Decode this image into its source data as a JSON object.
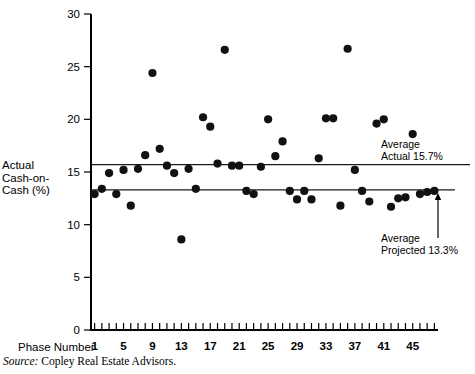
{
  "chart_data": {
    "type": "scatter",
    "title": "",
    "xlabel": "Phase Number",
    "ylabel": "Actual\nCash-on-\nCash (%)",
    "xlim": [
      0,
      49
    ],
    "ylim": [
      0,
      30
    ],
    "grid": false,
    "legend": "none",
    "x_ticks_labeled": [
      1,
      5,
      9,
      13,
      17,
      21,
      25,
      29,
      33,
      37,
      41,
      45
    ],
    "x_tick_count": 48,
    "y_ticks": [
      0,
      5,
      10,
      15,
      20,
      25,
      30
    ],
    "x": [
      1,
      2,
      3,
      4,
      5,
      6,
      7,
      8,
      9,
      10,
      11,
      12,
      13,
      14,
      15,
      16,
      17,
      18,
      19,
      20,
      21,
      22,
      23,
      24,
      25,
      26,
      27,
      28,
      29,
      30,
      31,
      32,
      33,
      34,
      35,
      36,
      37,
      38,
      39,
      40,
      41,
      42,
      43,
      44,
      45,
      46,
      47,
      48
    ],
    "y": [
      12.9,
      13.4,
      14.9,
      12.9,
      15.2,
      11.8,
      15.3,
      16.6,
      24.4,
      17.2,
      15.6,
      14.9,
      8.6,
      15.3,
      13.4,
      20.2,
      19.3,
      15.8,
      26.6,
      15.6,
      15.6,
      13.2,
      12.9,
      15.5,
      20.0,
      16.5,
      17.9,
      13.2,
      12.4,
      13.2,
      12.4,
      16.3,
      20.1,
      20.1,
      11.8,
      26.7,
      15.2,
      13.2,
      12.2,
      19.6,
      20.0,
      11.7,
      12.5,
      12.6,
      18.6,
      12.9,
      13.1,
      13.2
    ],
    "reference_lines": [
      {
        "name": "Average Actual",
        "value": 15.7,
        "label": "Average\nActual 15.7%"
      },
      {
        "name": "Average Projected",
        "value": 13.3,
        "label": "Average\nProjected 13.3%"
      }
    ]
  },
  "axes": {
    "y_title": "Actual\nCash-on-\nCash (%)",
    "x_title": "Phase Number",
    "y_tick_labels": [
      "0",
      "5",
      "10",
      "15",
      "20",
      "25",
      "30"
    ],
    "x_tick_labels": [
      "1",
      "5",
      "9",
      "13",
      "17",
      "21",
      "25",
      "29",
      "33",
      "37",
      "41",
      "45"
    ]
  },
  "annotations": {
    "average_actual": "Average\nActual 15.7%",
    "average_projected": "Average\nProjected 13.3%"
  },
  "footer": {
    "source_word": "Source:",
    "source_text": " Copley Real Estate Advisors."
  },
  "colors": {
    "point": "#111111",
    "axis": "#000000",
    "reference_line": "#1a1a1a",
    "background": "#ffffff"
  }
}
